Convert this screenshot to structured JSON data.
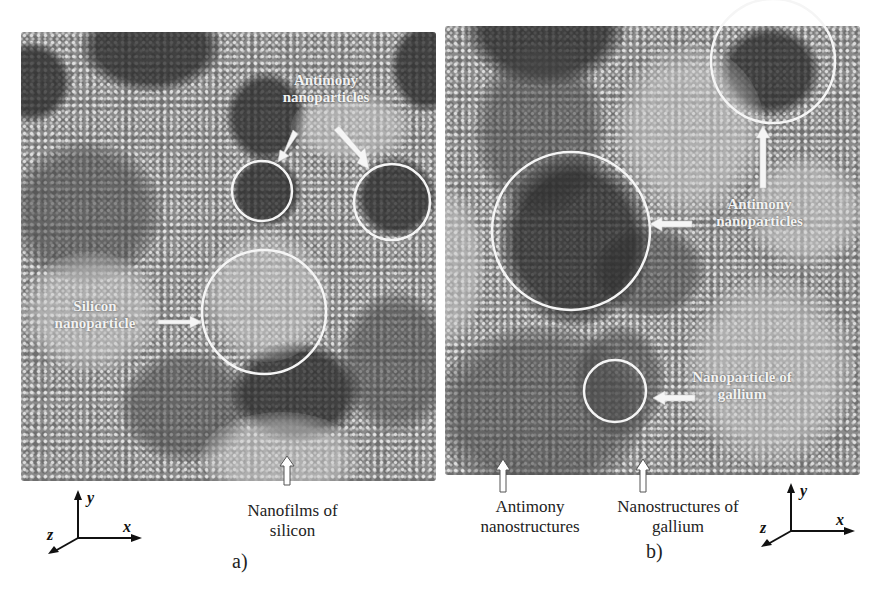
{
  "figure": {
    "panels": [
      {
        "id": "a",
        "label": "a)",
        "annotations": {
          "antimony": {
            "line1": "Antimony",
            "line2": "nanoparticles"
          },
          "silicon": {
            "line1": "Silicon",
            "line2": "nanoparticle"
          }
        },
        "caption": {
          "line1": "Nanofilms of",
          "line2": "silicon"
        },
        "axes": {
          "x": "x",
          "y": "y",
          "z": "z"
        }
      },
      {
        "id": "b",
        "label": "b)",
        "annotations": {
          "antimony": {
            "line1": "Antimony",
            "line2": "nanoparticles"
          },
          "gallium": {
            "line1": "Nanoparticle of",
            "line2": "gallium"
          }
        },
        "captions": [
          {
            "line1": "Antimony",
            "line2": "nanostructures"
          },
          {
            "line1": "Nanostructures of",
            "line2": "gallium"
          }
        ],
        "axes": {
          "x": "x",
          "y": "y",
          "z": "z"
        }
      }
    ],
    "colors": {
      "background": "#ffffff",
      "highlight_circle": "#f5f5f5",
      "arrow": "#f5f5f5",
      "text": "#222222"
    }
  }
}
